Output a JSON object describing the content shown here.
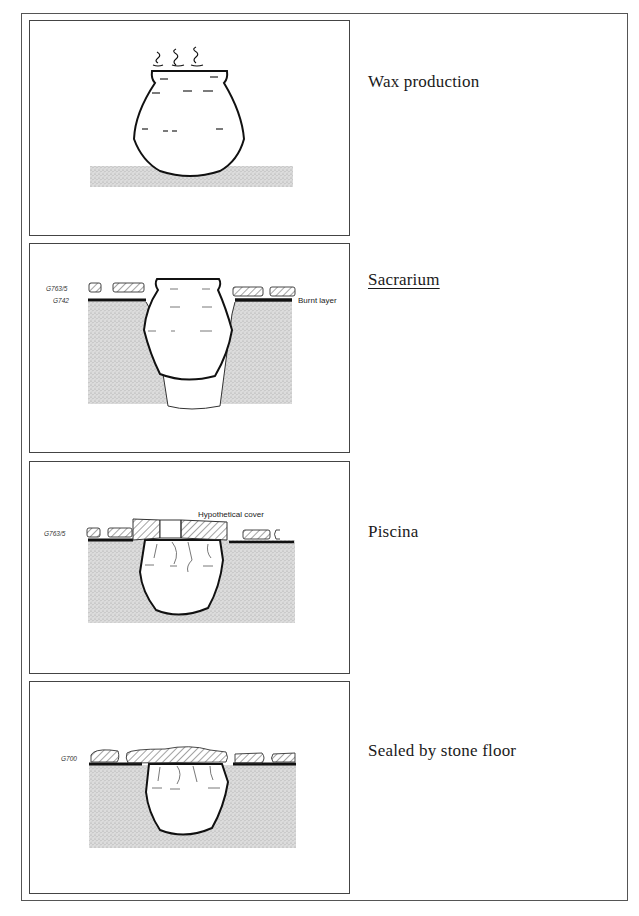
{
  "figure": {
    "panels": [
      {
        "id": "wax-production",
        "label": "Wax production",
        "underlined": false,
        "annotations": []
      },
      {
        "id": "sacrarium",
        "label": "Sacrarium",
        "underlined": true,
        "annotations": [
          {
            "text": "G763/5",
            "role": "layer-code"
          },
          {
            "text": "G742",
            "role": "layer-code"
          },
          {
            "text": "Burnt layer",
            "role": "callout"
          }
        ]
      },
      {
        "id": "piscina",
        "label": "Piscina",
        "underlined": false,
        "annotations": [
          {
            "text": "G763/5",
            "role": "layer-code"
          },
          {
            "text": "Hypothetical cover",
            "role": "callout"
          }
        ]
      },
      {
        "id": "sealed",
        "label": "Sealed by stone floor",
        "underlined": false,
        "annotations": [
          {
            "text": "G700",
            "role": "layer-code"
          }
        ]
      }
    ]
  },
  "colors": {
    "line": "#111111",
    "soil": "#d2d2d2",
    "border": "#444444"
  }
}
